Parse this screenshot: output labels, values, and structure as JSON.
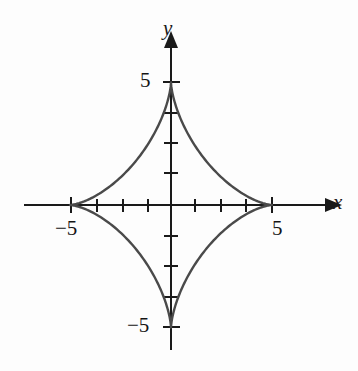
{
  "figure": {
    "kind": "cartesian-graph",
    "background_color": "#fdfdfd",
    "curve_color": "#4a4a4a",
    "axis_color": "#1a1a1a",
    "width": 358,
    "height": 371
  },
  "axes": {
    "x_axis_label": "x",
    "y_axis_label": "y",
    "origin_px": {
      "x": 171,
      "y": 205
    },
    "px_per_unit": {
      "x": 20.2,
      "y": 24.5
    },
    "x_tick_labels": [
      {
        "text": "−5",
        "value": -5
      },
      {
        "text": "5",
        "value": 5
      }
    ],
    "y_tick_labels": [
      {
        "text": "5",
        "value": 5
      },
      {
        "text": "−5",
        "value": -5
      }
    ],
    "unlabeled_tick_count_per_side": 4,
    "arrowheads": [
      "x-positive",
      "y-positive"
    ]
  },
  "chart_data": {
    "type": "line",
    "title": "",
    "xlabel": "x",
    "ylabel": "y",
    "grid": false,
    "legend": null,
    "xlim": [
      -6.8,
      8.0
    ],
    "ylim": [
      -6.8,
      7.1
    ],
    "xticks": [
      -5,
      5
    ],
    "yticks": [
      -5,
      5
    ],
    "xticklabels": [
      "−5",
      "5"
    ],
    "yticklabels": [
      "−5",
      "5"
    ],
    "series": [
      {
        "name": "astroid",
        "equation": "x^(2/3) + y^(2/3) = 5^(2/3)",
        "parametric": {
          "x": "5*cos(t)^3",
          "y": "5*sin(t)^3",
          "t_range": [
            0,
            6.283185307179586
          ]
        },
        "closed": true,
        "cusps": [
          {
            "x": 5,
            "y": 0
          },
          {
            "x": 0,
            "y": 5
          },
          {
            "x": -5,
            "y": 0
          },
          {
            "x": 0,
            "y": -5
          }
        ],
        "points": [
          {
            "x": 5.0,
            "y": 0.0
          },
          {
            "x": 4.83,
            "y": 0.06
          },
          {
            "x": 4.35,
            "y": 0.33
          },
          {
            "x": 3.6,
            "y": 0.92
          },
          {
            "x": 2.7,
            "y": 1.77
          },
          {
            "x": 1.77,
            "y": 2.7
          },
          {
            "x": 0.92,
            "y": 3.6
          },
          {
            "x": 0.33,
            "y": 4.35
          },
          {
            "x": 0.06,
            "y": 4.83
          },
          {
            "x": 0.0,
            "y": 5.0
          },
          {
            "x": -0.06,
            "y": 4.83
          },
          {
            "x": -0.33,
            "y": 4.35
          },
          {
            "x": -0.92,
            "y": 3.6
          },
          {
            "x": -1.77,
            "y": 2.7
          },
          {
            "x": -2.7,
            "y": 1.77
          },
          {
            "x": -3.6,
            "y": 0.92
          },
          {
            "x": -4.35,
            "y": 0.33
          },
          {
            "x": -4.83,
            "y": 0.06
          },
          {
            "x": -5.0,
            "y": 0.0
          },
          {
            "x": -4.83,
            "y": -0.06
          },
          {
            "x": -4.35,
            "y": -0.33
          },
          {
            "x": -3.6,
            "y": -0.92
          },
          {
            "x": -2.7,
            "y": -1.77
          },
          {
            "x": -1.77,
            "y": -2.7
          },
          {
            "x": -0.92,
            "y": -3.6
          },
          {
            "x": -0.33,
            "y": -4.35
          },
          {
            "x": -0.06,
            "y": -4.83
          },
          {
            "x": 0.0,
            "y": -5.0
          },
          {
            "x": 0.06,
            "y": -4.83
          },
          {
            "x": 0.33,
            "y": -4.35
          },
          {
            "x": 0.92,
            "y": -3.6
          },
          {
            "x": 1.77,
            "y": -2.7
          },
          {
            "x": 2.7,
            "y": -1.77
          },
          {
            "x": 3.6,
            "y": -0.92
          },
          {
            "x": 4.35,
            "y": -0.33
          },
          {
            "x": 4.83,
            "y": -0.06
          },
          {
            "x": 5.0,
            "y": 0.0
          }
        ]
      }
    ]
  }
}
